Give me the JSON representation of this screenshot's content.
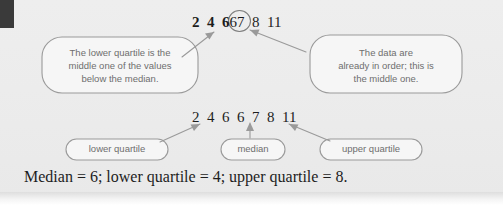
{
  "figure": {
    "title_present": false,
    "background_color": "#ececec",
    "line_color": "#9a9a9a",
    "text_color": "#6e6e6e",
    "number_color": "#1d1d1d",
    "corner_block_color": "#3a3a3a"
  },
  "data_rows": {
    "top": {
      "label": "top-data-sequence",
      "segment_bold": "2  4  6",
      "segment_circled": "6",
      "segment_plain": "7  8  11",
      "values": [
        2,
        4,
        6,
        6,
        7,
        8,
        11
      ],
      "circled_value": 6,
      "bold_values": [
        2,
        4,
        6
      ]
    },
    "bottom": {
      "label": "bottom-data-sequence",
      "text": "2  4  6  6  7  8  11",
      "values": [
        2,
        4,
        6,
        6,
        7,
        8,
        11
      ]
    }
  },
  "callouts": {
    "left": {
      "name": "lower-quartile-callout",
      "text": "The lower quartile is the\nmiddle one of the values\nbelow the median."
    },
    "right": {
      "name": "median-order-callout",
      "text": "The data are\nalready in order; this is\nthe middle one."
    }
  },
  "pills": {
    "lower": {
      "name": "lower-quartile-pill",
      "label": "lower quartile"
    },
    "median": {
      "name": "median-pill",
      "label": "median"
    },
    "upper": {
      "name": "upper-quartile-pill",
      "label": "upper quartile"
    }
  },
  "summary": {
    "text": "Median = 6; lower quartile = 4; upper quartile = 8.",
    "median": 6,
    "lower_quartile": 4,
    "upper_quartile": 8
  }
}
